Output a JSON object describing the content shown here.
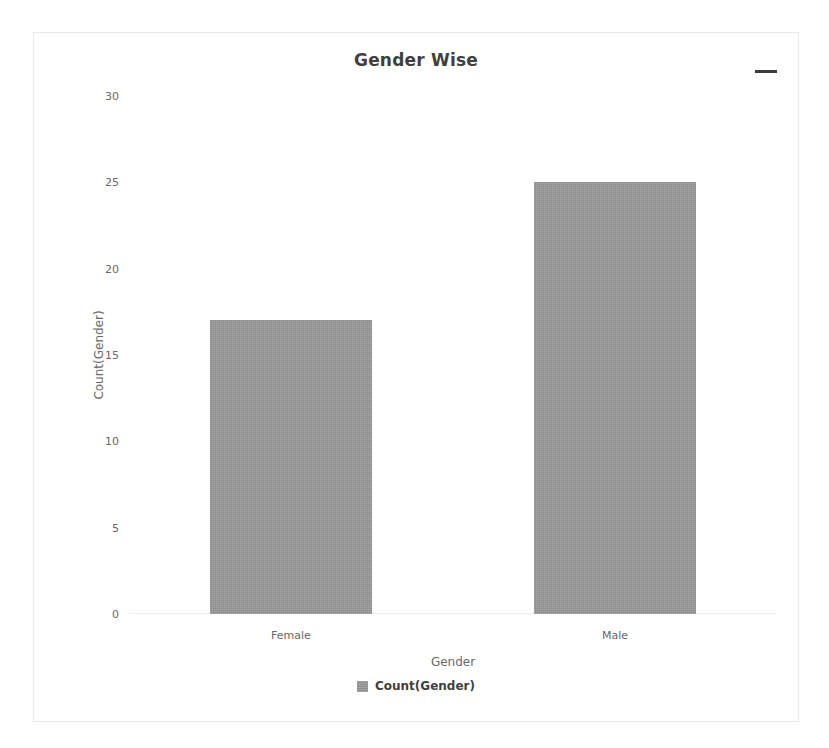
{
  "card": {
    "menu_icon": "hamburger-menu-icon",
    "menu_tooltip": "Chart context menu"
  },
  "chart_data": {
    "type": "bar",
    "title": "Gender Wise",
    "subtitle": "",
    "xlabel": "Gender",
    "ylabel": "Count(Gender)",
    "categories": [
      "Female",
      "Male"
    ],
    "values": [
      17,
      25
    ],
    "series": [
      {
        "name": "Count(Gender)",
        "values": [
          17,
          25
        ]
      }
    ],
    "ylim": [
      0,
      30
    ],
    "ytick_step": 5,
    "yticks": [
      "0",
      "5",
      "10",
      "15",
      "20",
      "25",
      "30"
    ],
    "grid": false,
    "legend_position": "bottom",
    "bar_color": "#9b9b9b",
    "title_color": "#3f3f3f",
    "axis_text_color": "#67686b"
  }
}
